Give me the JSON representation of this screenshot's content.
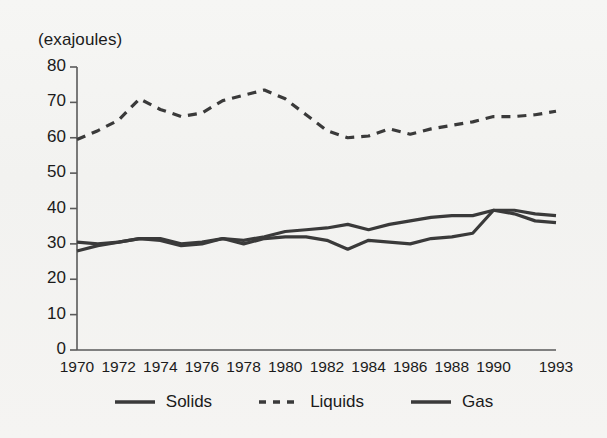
{
  "figure": {
    "axis_unit_label": "(exajoules)",
    "background_color": "#f4f4f2",
    "ink_color": "#262626",
    "axis_color": "#5a5a5a"
  },
  "legend": {
    "position": "bottom-center",
    "entries": [
      {
        "label": "Solids",
        "style": "solid",
        "color": "#3a3a3a",
        "swatch": "solid-line-swatch"
      },
      {
        "label": "Liquids",
        "style": "dashed",
        "color": "#3a3a3a",
        "swatch": "dashed-line-swatch"
      },
      {
        "label": "Gas",
        "style": "solid",
        "color": "#3a3a3a",
        "swatch": "solid-line-swatch"
      }
    ]
  },
  "chart_data": {
    "type": "line",
    "title": "",
    "subtitle": "",
    "xlabel": "",
    "ylabel": "(exajoules)",
    "ylim": [
      0,
      80
    ],
    "yticks": [
      0,
      10,
      20,
      30,
      40,
      50,
      60,
      70,
      80
    ],
    "ytick_labels": [
      "0",
      "10",
      "20",
      "30",
      "40",
      "50",
      "60",
      "70",
      "80"
    ],
    "xlim": [
      1970,
      1993
    ],
    "xticks": [
      1970,
      1972,
      1974,
      1976,
      1978,
      1980,
      1982,
      1984,
      1986,
      1988,
      1990,
      1993
    ],
    "xtick_labels": [
      "1970",
      "1972",
      "1974",
      "1976",
      "1978",
      "1980",
      "1982",
      "1984",
      "1986",
      "1988",
      "1990",
      "1993"
    ],
    "grid": false,
    "legend_position": "bottom",
    "x": [
      1970,
      1971,
      1972,
      1973,
      1974,
      1975,
      1976,
      1977,
      1978,
      1979,
      1980,
      1981,
      1982,
      1983,
      1984,
      1985,
      1986,
      1987,
      1988,
      1989,
      1990,
      1991,
      1992,
      1993
    ],
    "series": [
      {
        "name": "Solids",
        "style": "solid",
        "color": "#3a3a3a",
        "values": [
          30.5,
          30.0,
          30.5,
          31.5,
          31.5,
          30.0,
          30.5,
          31.5,
          31.0,
          32.0,
          33.5,
          34.0,
          34.5,
          35.5,
          34.0,
          35.5,
          36.5,
          37.5,
          38.0,
          38.0,
          39.5,
          39.5,
          38.5,
          38.0
        ]
      },
      {
        "name": "Liquids",
        "style": "dashed",
        "color": "#3a3a3a",
        "values": [
          59.5,
          62.0,
          65.0,
          71.0,
          68.0,
          66.0,
          67.0,
          70.5,
          72.0,
          73.5,
          71.0,
          66.5,
          62.0,
          60.0,
          60.5,
          62.5,
          61.0,
          62.5,
          63.5,
          64.5,
          66.0,
          66.0,
          66.5,
          67.5
        ]
      },
      {
        "name": "Gas",
        "style": "solid",
        "color": "#3a3a3a",
        "values": [
          28.0,
          29.5,
          30.5,
          31.5,
          31.0,
          29.5,
          30.0,
          31.5,
          30.0,
          31.5,
          32.0,
          32.0,
          31.0,
          28.5,
          31.0,
          30.5,
          30.0,
          31.5,
          32.0,
          33.0,
          39.5,
          38.5,
          36.5,
          36.0
        ]
      }
    ]
  }
}
